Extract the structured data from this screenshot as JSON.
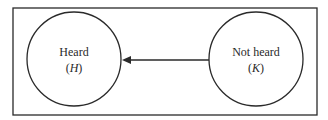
{
  "diagram": {
    "nodes": [
      {
        "id": "heard",
        "label": "Heard",
        "symbol": "H"
      },
      {
        "id": "not_heard",
        "label": "Not heard",
        "symbol": "K"
      }
    ],
    "edges": [
      {
        "from": "not_heard",
        "to": "heard",
        "type": "arrow"
      }
    ],
    "colors": {
      "stroke": "#2a2a2a",
      "background": "#ffffff"
    }
  }
}
